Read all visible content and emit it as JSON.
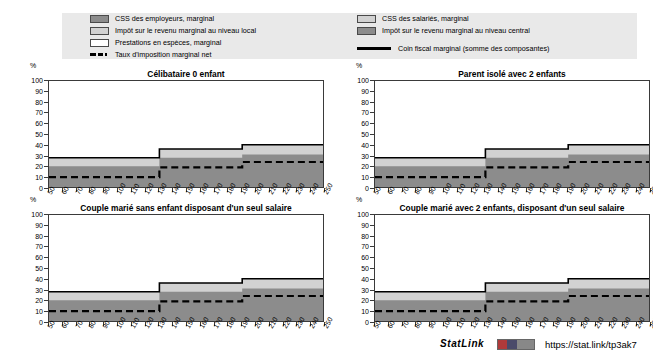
{
  "legend": {
    "items_left": [
      {
        "label": "CSS des employeurs, marginal",
        "swatch": "swatch-dark-gray"
      },
      {
        "label": "Impôt sur le revenu marginal au niveau local",
        "swatch": "swatch-light-gray"
      },
      {
        "label": "Prestations en espèces, marginal",
        "swatch": "swatch-white"
      }
    ],
    "items_right": [
      {
        "label": "CSS des salariés, marginal",
        "swatch": "swatch-light-gray"
      },
      {
        "label": "Impôt sur le revenu marginal au niveau central",
        "swatch": "swatch-dark-gray"
      }
    ],
    "dashed_label": "Taux d'imposition marginal net",
    "solid_label": "Coin fiscal marginal (somme des composantes)"
  },
  "axis": {
    "unit": "%",
    "y_ticks": [
      100,
      90,
      80,
      70,
      60,
      50,
      40,
      30,
      20,
      10,
      0
    ],
    "x_ticks": [
      50,
      60,
      70,
      80,
      90,
      100,
      110,
      120,
      130,
      140,
      150,
      160,
      170,
      180,
      190,
      200,
      210,
      220,
      230,
      240,
      250
    ]
  },
  "colors": {
    "dark_gray": "#8c8c8c",
    "light_gray": "#d2d2d2",
    "white": "#ffffff",
    "line": "#000000",
    "legend_bg": "#e9e9e9",
    "axis": "#3a3a3a"
  },
  "footer": {
    "statlink_label": "StatLink",
    "statlink_badge": "statlink-badge-icon",
    "url": "https://stat.link/tp3ak7"
  },
  "chart_data": [
    {
      "id": "celibataire-0-enfant",
      "type": "area",
      "title": "Célibataire 0 enfant",
      "xlabel": "",
      "ylabel": "%",
      "xlim": [
        50,
        250
      ],
      "ylim": [
        0,
        100
      ],
      "grid": false,
      "legend_position": "top",
      "x": [
        50,
        60,
        70,
        80,
        90,
        100,
        110,
        120,
        130,
        140,
        150,
        160,
        170,
        180,
        190,
        200,
        210,
        220,
        230,
        240,
        250
      ],
      "series": [
        {
          "name": "CSS des employeurs, marginal + Impôt central (empilé bas)",
          "values": [
            21,
            21,
            21,
            21,
            21,
            21,
            21,
            21,
            29,
            29,
            29,
            29,
            29,
            29,
            32,
            32,
            32,
            32,
            32,
            32,
            32
          ]
        },
        {
          "name": "CSS des salariés / Impôt local (bande claire)",
          "values": [
            29,
            29,
            29,
            29,
            29,
            29,
            29,
            29,
            37,
            37,
            37,
            37,
            37,
            37,
            41,
            41,
            41,
            41,
            41,
            41,
            41
          ]
        }
      ],
      "coin_fiscal_marginal": [
        29,
        29,
        29,
        29,
        29,
        29,
        29,
        29,
        37,
        37,
        37,
        37,
        37,
        37,
        41,
        41,
        41,
        41,
        41,
        41,
        41
      ],
      "taux_imposition_marginal_net": [
        11,
        11,
        11,
        11,
        11,
        11,
        11,
        11,
        20,
        20,
        20,
        20,
        20,
        20,
        25,
        25,
        25,
        25,
        25,
        25,
        25
      ],
      "step_x": [
        130,
        190
      ]
    },
    {
      "id": "parent-isole-2-enfants",
      "type": "area",
      "title": "Parent isolé avec 2 enfants",
      "xlabel": "",
      "ylabel": "%",
      "xlim": [
        50,
        250
      ],
      "ylim": [
        0,
        100
      ],
      "grid": false,
      "legend_position": "top",
      "x": [
        50,
        60,
        70,
        80,
        90,
        100,
        110,
        120,
        130,
        140,
        150,
        160,
        170,
        180,
        190,
        200,
        210,
        220,
        230,
        240,
        250
      ],
      "series": [
        {
          "name": "CSS des employeurs, marginal + Impôt central (empilé bas)",
          "values": [
            21,
            21,
            21,
            21,
            21,
            21,
            21,
            21,
            29,
            29,
            29,
            29,
            29,
            29,
            32,
            32,
            32,
            32,
            32,
            32,
            32
          ]
        },
        {
          "name": "CSS des salariés / Impôt local (bande claire)",
          "values": [
            29,
            29,
            29,
            29,
            29,
            29,
            29,
            29,
            37,
            37,
            37,
            37,
            37,
            37,
            41,
            41,
            41,
            41,
            41,
            41,
            41
          ]
        }
      ],
      "coin_fiscal_marginal": [
        29,
        29,
        29,
        29,
        29,
        29,
        29,
        29,
        37,
        37,
        37,
        37,
        37,
        37,
        41,
        41,
        41,
        41,
        41,
        41,
        41
      ],
      "taux_imposition_marginal_net": [
        11,
        11,
        11,
        11,
        11,
        11,
        11,
        11,
        20,
        20,
        20,
        20,
        20,
        20,
        25,
        25,
        25,
        25,
        25,
        25,
        25
      ],
      "step_x": [
        130,
        185
      ]
    },
    {
      "id": "couple-marie-sans-enfant",
      "type": "area",
      "title": "Couple marié sans enfant disposant d'un seul salaire",
      "xlabel": "",
      "ylabel": "%",
      "xlim": [
        50,
        250
      ],
      "ylim": [
        0,
        100
      ],
      "grid": false,
      "legend_position": "top",
      "x": [
        50,
        60,
        70,
        80,
        90,
        100,
        110,
        120,
        130,
        140,
        150,
        160,
        170,
        180,
        190,
        200,
        210,
        220,
        230,
        240,
        250
      ],
      "series": [
        {
          "name": "CSS des employeurs, marginal + Impôt central (empilé bas)",
          "values": [
            21,
            21,
            21,
            21,
            21,
            21,
            21,
            21,
            29,
            29,
            29,
            29,
            29,
            29,
            32,
            32,
            32,
            32,
            32,
            32,
            32
          ]
        },
        {
          "name": "CSS des salariés / Impôt local (bande claire)",
          "values": [
            29,
            29,
            29,
            29,
            29,
            29,
            29,
            29,
            37,
            37,
            37,
            37,
            37,
            37,
            41,
            41,
            41,
            41,
            41,
            41,
            41
          ]
        }
      ],
      "coin_fiscal_marginal": [
        29,
        29,
        29,
        29,
        29,
        29,
        29,
        29,
        37,
        37,
        37,
        37,
        37,
        37,
        41,
        41,
        41,
        41,
        41,
        41,
        41
      ],
      "taux_imposition_marginal_net": [
        11,
        11,
        11,
        11,
        11,
        11,
        11,
        11,
        20,
        20,
        20,
        20,
        20,
        20,
        25,
        25,
        25,
        25,
        25,
        25,
        25
      ],
      "step_x": [
        130,
        185
      ]
    },
    {
      "id": "couple-marie-2-enfants",
      "type": "area",
      "title": "Couple marié avec 2 enfants, disposant d'un seul salaire",
      "xlabel": "",
      "ylabel": "%",
      "xlim": [
        50,
        250
      ],
      "ylim": [
        0,
        100
      ],
      "grid": false,
      "legend_position": "top",
      "x": [
        50,
        60,
        70,
        80,
        90,
        100,
        110,
        120,
        130,
        140,
        150,
        160,
        170,
        180,
        190,
        200,
        210,
        220,
        230,
        240,
        250
      ],
      "series": [
        {
          "name": "CSS des employeurs, marginal + Impôt central (empilé bas)",
          "values": [
            21,
            21,
            21,
            21,
            21,
            21,
            21,
            21,
            29,
            29,
            29,
            29,
            29,
            29,
            32,
            32,
            32,
            32,
            32,
            32,
            32
          ]
        },
        {
          "name": "CSS des salariés / Impôt local (bande claire)",
          "values": [
            29,
            29,
            29,
            29,
            29,
            29,
            29,
            29,
            37,
            37,
            37,
            37,
            37,
            37,
            41,
            41,
            41,
            41,
            41,
            41,
            41
          ]
        }
      ],
      "coin_fiscal_marginal": [
        29,
        29,
        29,
        29,
        29,
        29,
        29,
        29,
        37,
        37,
        37,
        37,
        37,
        37,
        41,
        41,
        41,
        41,
        41,
        41,
        41
      ],
      "taux_imposition_marginal_net": [
        11,
        11,
        11,
        11,
        11,
        11,
        11,
        11,
        20,
        20,
        20,
        20,
        20,
        20,
        25,
        25,
        25,
        25,
        25,
        25,
        25
      ],
      "step_x": [
        130,
        185
      ]
    }
  ]
}
